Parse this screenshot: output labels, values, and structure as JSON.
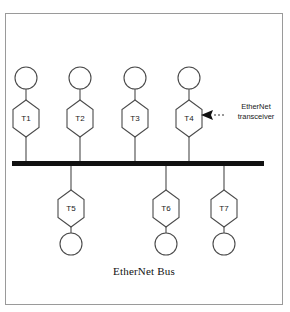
{
  "figure": {
    "caption": "EtherNet Bus",
    "bus": {
      "name": "EtherNet Bus",
      "color": "#111111",
      "x_start": 12,
      "x_end": 264,
      "y": 161,
      "thickness": 5
    },
    "annotation": {
      "line1": "EtherNet",
      "line2": "transceiver",
      "points_to": "T4",
      "arrow_direction": "left"
    },
    "top_nodes": [
      {
        "label": "T1",
        "cx": 26
      },
      {
        "label": "T2",
        "cx": 80
      },
      {
        "label": "T3",
        "cx": 135
      },
      {
        "label": "T4",
        "cx": 189
      }
    ],
    "bottom_nodes": [
      {
        "label": "T5",
        "cx": 71
      },
      {
        "label": "T6",
        "cx": 166
      },
      {
        "label": "T7",
        "cx": 224
      }
    ],
    "colors": {
      "frame_border": "#9a9a9a",
      "outline": "#4a4a4a",
      "bus": "#111111",
      "text": "#1a1a1a",
      "background": "#ffffff"
    }
  }
}
